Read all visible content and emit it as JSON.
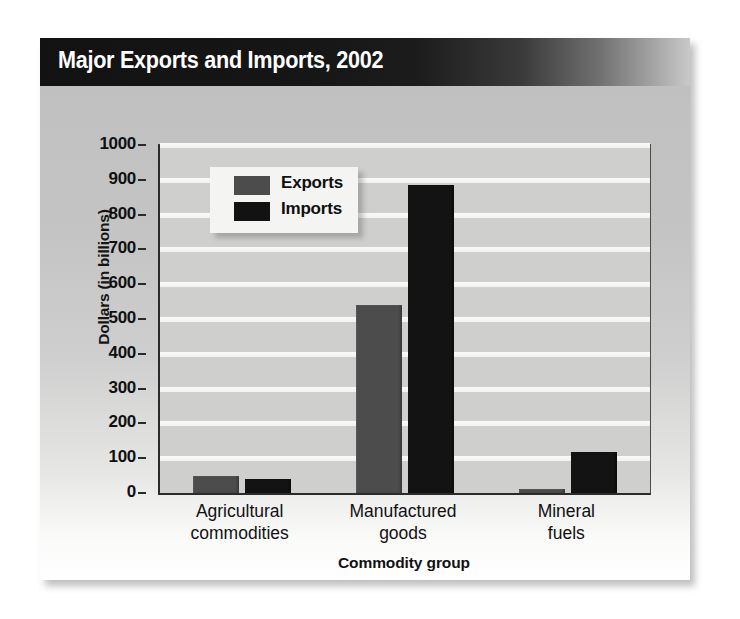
{
  "figure": {
    "title": "Major Exports and Imports, 2002",
    "source": "Source:  U.S. Census Bureau"
  },
  "colors": {
    "exports": "#4c4c4c",
    "imports": "#131313",
    "title_bar": "#121212",
    "plot_background": "#cfcfcd",
    "legend_panel": "#f4f4f2"
  },
  "chart_data": {
    "type": "bar",
    "title": "Major Exports and Imports, 2002",
    "xlabel": "Commodity group",
    "ylabel": "Dollars (in billions)",
    "ylim": [
      0,
      1000
    ],
    "yticks": [
      0,
      100,
      200,
      300,
      400,
      500,
      600,
      700,
      800,
      900,
      1000
    ],
    "ytick_labels": [
      "0",
      "100",
      "200",
      "300",
      "400",
      "500",
      "600",
      "700",
      "800",
      "900",
      "1000"
    ],
    "grid": true,
    "legend_position": "upper left",
    "categories": [
      "Agricultural commodities",
      "Manufactured goods",
      "Mineral fuels"
    ],
    "category_lines": [
      [
        "Agricultural",
        "commodities"
      ],
      [
        "Manufactured",
        "goods"
      ],
      [
        "Mineral",
        "fuels"
      ]
    ],
    "series": [
      {
        "name": "Exports",
        "color": "#4c4c4c",
        "values": [
          50,
          540,
          12
        ]
      },
      {
        "name": "Imports",
        "color": "#131313",
        "values": [
          40,
          885,
          118
        ]
      }
    ],
    "units": "billions of dollars",
    "source": "U.S. Census Bureau"
  }
}
